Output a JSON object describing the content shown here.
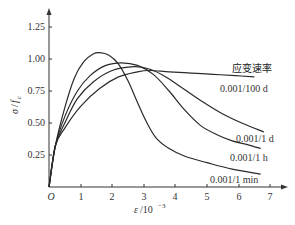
{
  "chart_data": {
    "type": "line",
    "title": "",
    "xlabel": "ε/10⁻³",
    "ylabel": "σ/f_c",
    "xlim": [
      0,
      7
    ],
    "ylim": [
      0,
      1.25
    ],
    "grid": false,
    "legend_title": "应变速率",
    "x_ticks": [
      "O",
      "1",
      "2",
      "3",
      "4",
      "5",
      "6",
      "7"
    ],
    "y_ticks": [
      "0.25",
      "0.50",
      "0.75",
      "1.00",
      "1.25"
    ],
    "series": [
      {
        "name": "0.001/1 min",
        "points": [
          [
            0,
            0
          ],
          [
            0.2,
            0.32
          ],
          [
            0.5,
            0.62
          ],
          [
            0.8,
            0.85
          ],
          [
            1.1,
            0.98
          ],
          [
            1.4,
            1.04
          ],
          [
            1.6,
            1.05
          ],
          [
            1.9,
            1.03
          ],
          [
            2.2,
            0.96
          ],
          [
            2.5,
            0.83
          ],
          [
            2.8,
            0.66
          ],
          [
            3.1,
            0.5
          ],
          [
            3.4,
            0.38
          ],
          [
            3.8,
            0.3
          ],
          [
            4.3,
            0.24
          ],
          [
            5.0,
            0.19
          ],
          [
            5.8,
            0.14
          ],
          [
            6.7,
            0.1
          ]
        ]
      },
      {
        "name": "0.001/1 h",
        "points": [
          [
            0,
            0
          ],
          [
            0.2,
            0.32
          ],
          [
            0.5,
            0.55
          ],
          [
            0.9,
            0.75
          ],
          [
            1.3,
            0.87
          ],
          [
            1.8,
            0.95
          ],
          [
            2.3,
            0.97
          ],
          [
            2.8,
            0.95
          ],
          [
            3.3,
            0.88
          ],
          [
            3.8,
            0.75
          ],
          [
            4.3,
            0.6
          ],
          [
            4.8,
            0.48
          ],
          [
            5.3,
            0.41
          ],
          [
            5.8,
            0.36
          ],
          [
            6.3,
            0.33
          ],
          [
            6.7,
            0.3
          ]
        ]
      },
      {
        "name": "0.001/1 d",
        "points": [
          [
            0,
            0
          ],
          [
            0.2,
            0.32
          ],
          [
            0.5,
            0.5
          ],
          [
            0.9,
            0.69
          ],
          [
            1.4,
            0.82
          ],
          [
            2.0,
            0.91
          ],
          [
            2.7,
            0.94
          ],
          [
            3.2,
            0.92
          ],
          [
            3.7,
            0.86
          ],
          [
            4.3,
            0.76
          ],
          [
            4.9,
            0.66
          ],
          [
            5.5,
            0.57
          ],
          [
            6.1,
            0.5
          ],
          [
            6.8,
            0.43
          ]
        ]
      },
      {
        "name": "0.001/100 d",
        "points": [
          [
            0,
            0
          ],
          [
            0.2,
            0.32
          ],
          [
            0.5,
            0.46
          ],
          [
            1.0,
            0.63
          ],
          [
            1.6,
            0.77
          ],
          [
            2.2,
            0.86
          ],
          [
            2.8,
            0.9
          ],
          [
            3.2,
            0.91
          ],
          [
            3.8,
            0.9
          ],
          [
            4.5,
            0.89
          ],
          [
            5.2,
            0.88
          ],
          [
            5.9,
            0.87
          ],
          [
            6.5,
            0.86
          ]
        ]
      }
    ]
  },
  "labels": {
    "legend_title": "应变速率",
    "series_100d": "0.001/100 d",
    "series_1d": "0.001/1 d",
    "series_1h": "0.001/1 h",
    "series_1min": "0.001/1 min",
    "xlabel_eps": "ε",
    "xlabel_unit": "/10",
    "xlabel_exp": "−3",
    "ylabel_sigma": "σ",
    "ylabel_sep": "/",
    "ylabel_f": "f",
    "ylabel_sub": "c",
    "origin": "O",
    "x1": "1",
    "x2": "2",
    "x3": "3",
    "x4": "4",
    "x5": "5",
    "x6": "6",
    "x7": "7",
    "y025": "0.25",
    "y050": "0.50",
    "y075": "0.75",
    "y100": "1.00",
    "y125": "1.25"
  },
  "colors": {
    "line": "#2a2a2a",
    "axis": "#333333",
    "background": "#ffffff"
  }
}
